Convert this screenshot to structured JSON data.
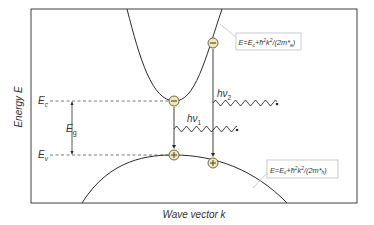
{
  "diagram": {
    "y_axis_label": "Energy E",
    "x_axis_label": "Wave vector k",
    "levels": {
      "conduction_edge": {
        "symbol": "E",
        "subscript": "c"
      },
      "valence_edge": {
        "symbol": "E",
        "subscript": "v"
      },
      "gap": {
        "symbol": "E",
        "subscript": "g"
      }
    },
    "photons": [
      {
        "label": "hν",
        "subscript": "1"
      },
      {
        "label": "hν",
        "subscript": "2"
      }
    ],
    "carriers": {
      "electron_symbol": "−",
      "hole_symbol": "+"
    },
    "equations": {
      "conduction_band": "E=Ec+ħ²k²/(2m*e)",
      "conduction_band_parts": {
        "pre": "E=E",
        "sub1": "c",
        "mid": "+ħ",
        "sup1": "2",
        "k": "k",
        "sup2": "2",
        "post": "/(2m*",
        "sub2": "e",
        "end": ")"
      },
      "valence_band": "E=Ec+ħ²k²/(2m*h)",
      "valence_band_parts": {
        "pre": "E=E",
        "sub1": "c",
        "mid": "+ħ",
        "sup1": "2",
        "k": "k",
        "sup2": "2",
        "post": "/(2m*",
        "sub2": "h",
        "end": ")"
      }
    },
    "colors": {
      "line": "#2b2b2b",
      "carrier_fill": "#f1eab0",
      "carrier_stroke": "#5a5a3a",
      "label_box_stroke": "#bdbdbd",
      "leader": "#c8c8c8"
    }
  }
}
